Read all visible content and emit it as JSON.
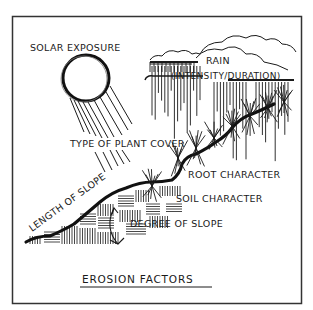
{
  "title": "EROSION FACTORS",
  "labels": {
    "solar": "SOLAR EXPOSURE",
    "rain_line1": "RAIN",
    "rain_line2": "(INTENSITY/DURATION)",
    "plant": "TYPE OF PLANT COVER",
    "root": "ROOT CHARACTER",
    "soil": "SOIL CHARACTER",
    "length": "LENGTH OF SLOPE",
    "degree": "DEGREE OF SLOPE"
  },
  "colors": {
    "ink": "#1a1a1a",
    "frame": "#333333",
    "background": "#ffffff"
  }
}
